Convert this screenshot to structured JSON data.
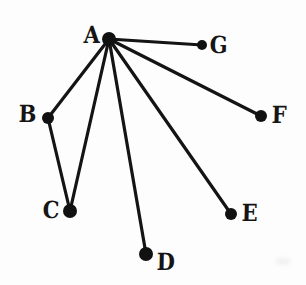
{
  "figure": {
    "width": 306,
    "height": 285,
    "background_color": "#fdfdfd",
    "ink_color": "#141414"
  },
  "chart_data": {
    "type": "diagram",
    "diagram_kind": "node-link-graph",
    "directed": false,
    "title": "",
    "nodes": [
      {
        "id": "A",
        "label": "A",
        "x": 109,
        "y": 39,
        "radius": 7,
        "label_x": 84,
        "label_y": 23,
        "label_side": "left"
      },
      {
        "id": "B",
        "label": "B",
        "x": 48,
        "y": 118,
        "radius": 6,
        "label_x": 19,
        "label_y": 102,
        "label_side": "left"
      },
      {
        "id": "C",
        "label": "C",
        "x": 70,
        "y": 211,
        "radius": 7,
        "label_x": 43,
        "label_y": 198,
        "label_side": "left"
      },
      {
        "id": "D",
        "label": "D",
        "x": 146,
        "y": 254,
        "radius": 7,
        "label_x": 157,
        "label_y": 250,
        "label_side": "right"
      },
      {
        "id": "E",
        "label": "E",
        "x": 231,
        "y": 214,
        "radius": 6,
        "label_x": 242,
        "label_y": 201,
        "label_side": "right"
      },
      {
        "id": "F",
        "label": "F",
        "x": 261,
        "y": 116,
        "radius": 6,
        "label_x": 272,
        "label_y": 103,
        "label_side": "right"
      },
      {
        "id": "G",
        "label": "G",
        "x": 202,
        "y": 45,
        "radius": 5,
        "label_x": 210,
        "label_y": 33,
        "label_side": "right"
      }
    ],
    "edges": [
      {
        "source": "A",
        "target": "G"
      },
      {
        "source": "A",
        "target": "F"
      },
      {
        "source": "A",
        "target": "E"
      },
      {
        "source": "A",
        "target": "D"
      },
      {
        "source": "A",
        "target": "C"
      },
      {
        "source": "A",
        "target": "B"
      },
      {
        "source": "B",
        "target": "C"
      }
    ],
    "node_count": 7,
    "edge_count": 7,
    "degrees": {
      "A": 6,
      "B": 2,
      "C": 2,
      "D": 1,
      "E": 1,
      "F": 1,
      "G": 1
    }
  },
  "artifacts": [
    {
      "name": "corner-smudge",
      "x": 275,
      "y": 258,
      "width": 16,
      "height": 7
    }
  ]
}
